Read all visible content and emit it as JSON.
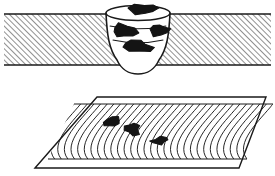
{
  "figure": {
    "background_color": "#ffffff",
    "line_color": "#1a1a1a",
    "defect_color": "#141414",
    "hatch_color": "#2b2b2b",
    "panels": [
      {
        "id": "cross-section",
        "name": "weld-cross-section-panel",
        "description": "Transverse cross-section of a butt weld in a hatched steel plate showing slag inclusions between passes"
      },
      {
        "id": "plan-view",
        "name": "weld-bead-plan-panel",
        "description": "Plan view of a weld bead with ripple marks and surface slag inclusions"
      }
    ],
    "cross_section": {
      "plate": {
        "name": "base-metal-plate",
        "x": 4,
        "y": 14,
        "width": 267,
        "height": 51,
        "hatch_angle_deg": 45,
        "hatch_spacing": 4
      },
      "weld": {
        "name": "weld-nugget",
        "top_ellipse_cx": 138,
        "top_ellipse_cy": 13,
        "top_ellipse_rx": 32,
        "top_ellipse_ry": 7.5,
        "bottom_y": 74,
        "pass_lines": 3
      },
      "inclusions": [
        {
          "name": "slag-inclusion-top",
          "cx": 143,
          "cy": 9,
          "rx": 12,
          "ry": 4.5,
          "rot": -4
        },
        {
          "name": "slag-inclusion-left",
          "cx": 125,
          "cy": 31,
          "rx": 11,
          "ry": 6,
          "rot": 8
        },
        {
          "name": "slag-inclusion-right",
          "cx": 159,
          "cy": 30,
          "rx": 9,
          "ry": 5,
          "rot": -6
        },
        {
          "name": "slag-inclusion-center",
          "cx": 138,
          "cy": 46,
          "rx": 12,
          "ry": 5,
          "rot": 5
        }
      ]
    },
    "plan_view": {
      "plate": {
        "name": "weld-plan-plate",
        "points": "35,168 97,97 266,97 239,168"
      },
      "bead": {
        "name": "weld-bead",
        "ripple_count": 30,
        "start_x": 48,
        "end_x": 247,
        "top_y": 104,
        "bottom_y": 159
      },
      "inclusions": [
        {
          "name": "bead-inclusion-1",
          "cx": 112,
          "cy": 122,
          "rx": 7,
          "ry": 4,
          "rot": -14
        },
        {
          "name": "bead-inclusion-2",
          "cx": 132,
          "cy": 129,
          "rx": 7,
          "ry": 5,
          "rot": 6
        },
        {
          "name": "bead-inclusion-3",
          "cx": 159,
          "cy": 141,
          "rx": 8,
          "ry": 3,
          "rot": -8
        }
      ]
    }
  }
}
